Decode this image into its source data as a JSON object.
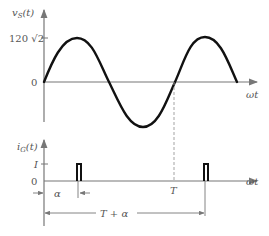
{
  "top_plot": {
    "ylabel": "v",
    "ylabel_sub": "S",
    "ylabel_arg": "(t)",
    "peak_label": "120 √2",
    "zero_label": "0",
    "xlabel": "ωt",
    "waveform": "sine",
    "cycles_shown": 2
  },
  "bottom_plot": {
    "ylabel": "i",
    "ylabel_sub": "G",
    "ylabel_arg": "(t)",
    "level_label": "I",
    "zero_label": "0",
    "xlabel": "ωt",
    "pulses": 2,
    "alpha_label": "α",
    "period_label": "T",
    "period_plus_alpha_label": "T + α"
  },
  "colors": {
    "waveform": "#111111",
    "axes": "#777777",
    "text": "#555555",
    "dashed": "#999999"
  }
}
